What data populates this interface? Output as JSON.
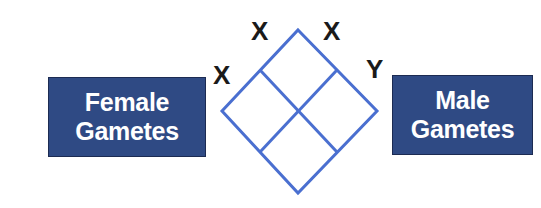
{
  "female_gametes": {
    "line1": "Female",
    "line2": "Gametes"
  },
  "male_gametes": {
    "line1": "Male",
    "line2": "Gametes"
  },
  "alleles": {
    "female_top": "X",
    "female_left": "X",
    "male_top": "X",
    "male_right": "Y"
  },
  "colors": {
    "box_fill": "#2f4a84",
    "grid_line": "#4a6fd0",
    "text": "#ffffff"
  }
}
